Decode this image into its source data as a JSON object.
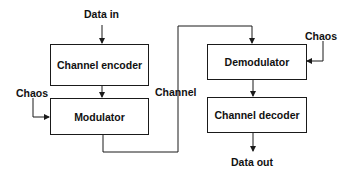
{
  "diagram": {
    "type": "block-diagram",
    "title": "",
    "blocks": {
      "channel_encoder": "Channel encoder",
      "modulator": "Modulator",
      "demodulator": "Demodulator",
      "channel_decoder": "Channel decoder"
    },
    "labels": {
      "data_in": "Data in",
      "data_out": "Data out",
      "channel": "Channel",
      "chaos_tx": "Chaos",
      "chaos_rx": "Chaos"
    },
    "edges": [
      {
        "from": "Data in",
        "to": "Channel encoder"
      },
      {
        "from": "Channel encoder",
        "to": "Modulator"
      },
      {
        "from": "Chaos",
        "to": "Modulator"
      },
      {
        "from": "Modulator",
        "to": "Demodulator",
        "label": "Channel"
      },
      {
        "from": "Chaos",
        "to": "Demodulator"
      },
      {
        "from": "Demodulator",
        "to": "Channel decoder"
      },
      {
        "from": "Channel decoder",
        "to": "Data out"
      }
    ],
    "colors": {
      "line": "#1a1a1a",
      "background": "#ffffff"
    }
  }
}
